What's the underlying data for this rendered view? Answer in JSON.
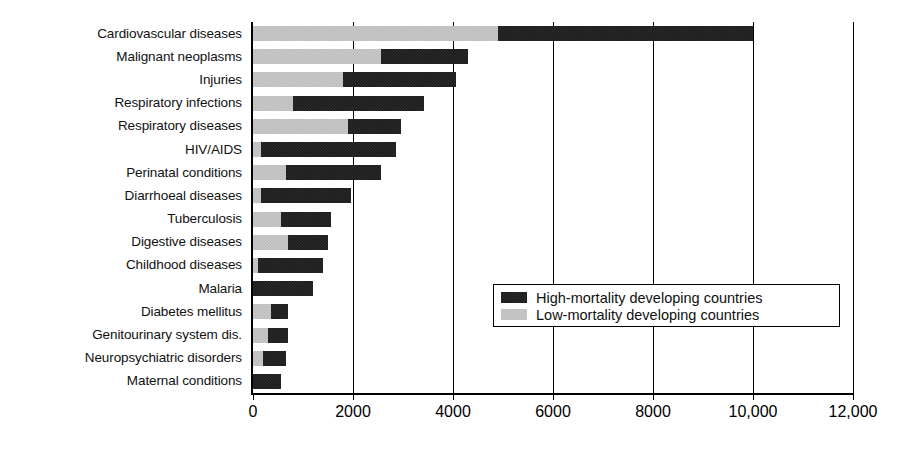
{
  "chart_data": {
    "type": "bar",
    "orientation": "horizontal",
    "stacked": true,
    "title": "",
    "subtitle": "",
    "xlabel": "",
    "ylabel": "",
    "xlim": [
      0,
      12000
    ],
    "grid": true,
    "legend_position": "inside-right-lower",
    "xticks": [
      0,
      2000,
      4000,
      6000,
      8000,
      10000,
      12000
    ],
    "xtick_labels": [
      "0",
      "2000",
      "4000",
      "6000",
      "8000",
      "10,000",
      "12,000"
    ],
    "categories": [
      "Cardiovascular diseases",
      "Malignant neoplasms",
      "Injuries",
      "Respiratory infections",
      "Respiratory diseases",
      "HIV/AIDS",
      "Perinatal conditions",
      "Diarrhoeal diseases",
      "Tuberculosis",
      "Digestive diseases",
      "Childhood diseases",
      "Malaria",
      "Diabetes mellitus",
      "Genitourinary system dis.",
      "Neuropsychiatric disorders",
      "Maternal conditions"
    ],
    "series": [
      {
        "name": "Low-mortality developing countries",
        "color": "#c9c9c9",
        "values": [
          4900,
          2550,
          1800,
          800,
          1900,
          150,
          650,
          160,
          550,
          700,
          100,
          0,
          350,
          300,
          200,
          0
        ]
      },
      {
        "name": "High-mortality developing countries",
        "color": "#1c1c1c",
        "values": [
          5100,
          1750,
          2250,
          2620,
          1050,
          2700,
          1900,
          1790,
          1010,
          800,
          1300,
          1200,
          350,
          400,
          450,
          550
        ]
      }
    ],
    "totals": [
      10000,
      4300,
      4050,
      3420,
      2950,
      2850,
      2550,
      1950,
      1560,
      1500,
      1400,
      1200,
      700,
      700,
      650,
      550
    ]
  },
  "legend": {
    "entries": [
      {
        "label": "High-mortality developing countries",
        "swatch": "high-mortality-swatch"
      },
      {
        "label": "Low-mortality developing countries",
        "swatch": "low-mortality-swatch"
      }
    ]
  }
}
